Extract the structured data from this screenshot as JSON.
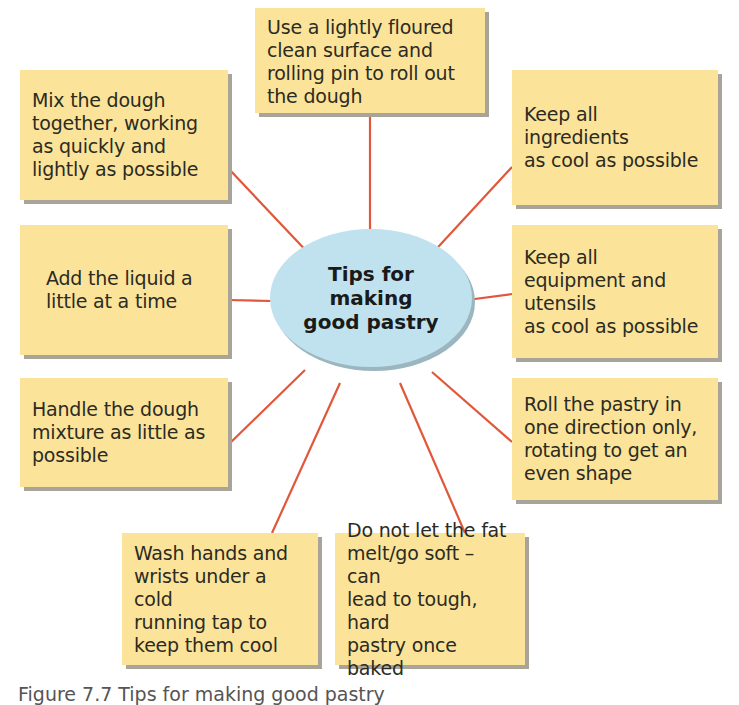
{
  "diagram": {
    "title": "Tips for making good pastry",
    "center_label": "Tips for\nmaking\ngood pastry",
    "colors": {
      "box_fill": "#fbe39a",
      "box_shadow": "#a9a49a",
      "center_fill": "#bfe2ee",
      "connector": "#e0573a"
    },
    "tips": [
      {
        "id": "top",
        "text": "Use a lightly floured\nclean surface and\nrolling pin to roll out\nthe dough"
      },
      {
        "id": "left-1",
        "text": "Mix the dough\ntogether, working\nas quickly and\nlightly as possible"
      },
      {
        "id": "right-1",
        "text": "Keep all ingredients\nas cool as possible"
      },
      {
        "id": "left-2",
        "text": "Add the liquid a\nlittle at a time"
      },
      {
        "id": "right-2",
        "text": "Keep all\nequipment and\nutensils\nas cool as possible"
      },
      {
        "id": "left-3",
        "text": "Handle the dough\nmixture as little as\npossible"
      },
      {
        "id": "right-3",
        "text": "Roll the pastry in\none direction only,\nrotating to get an\neven shape"
      },
      {
        "id": "bottom-left",
        "text": "Wash hands and\nwrists under a cold\nrunning tap to\nkeep them cool"
      },
      {
        "id": "bottom-right",
        "text": "Do not let the fat\nmelt/go soft – can\nlead to tough, hard\npastry once baked"
      }
    ],
    "caption": "Figure 7.7 Tips for making good pastry"
  }
}
